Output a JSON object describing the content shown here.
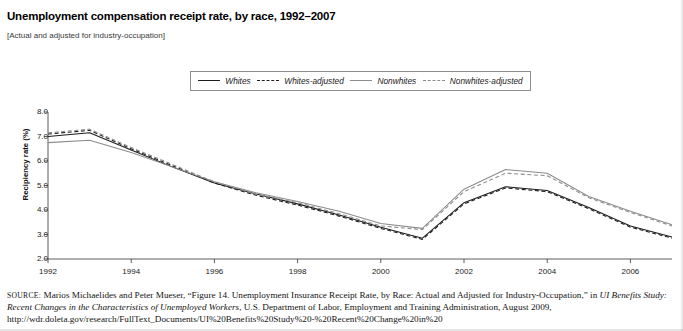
{
  "title": "Unemployment compensation receipt rate, by race, 1992–2007",
  "subtitle": "[Actual and adjusted for industry-occupation]",
  "legend": {
    "entries": [
      {
        "label": "Whites",
        "style": "solid",
        "color": "#1c1c1c"
      },
      {
        "label": "Whites-adjusted",
        "style": "dashed",
        "color": "#1c1c1c"
      },
      {
        "label": "Nonwhites",
        "style": "solid",
        "color": "#8c8c8c"
      },
      {
        "label": "Nonwhites-adjusted",
        "style": "dashed",
        "color": "#8c8c8c"
      }
    ]
  },
  "source": {
    "prefix": "SOURCE:",
    "text_1": " Marios Michaelides and Peter Mueser, “Figure 14. Unemployment Insurance Receipt Rate, by Race: Actual and Adjusted for Industry-Occupation,” in ",
    "italic_1": "UI Benefits Study: Recent Changes in the Characteristics of Unemployed Workers",
    "text_2": ", U.S. Department of Labor, Employment and Training Administration, August 2009, http://wdr.doleta.gov/research/FullText_Documents/UI%20Benefits%20Study%20-%20Recent%20Change%20in%20"
  },
  "chart_data": {
    "type": "line",
    "title": "Unemployment compensation receipt rate, by race, 1992–2007",
    "xlabel": "",
    "ylabel": "Recipiency rate (%)",
    "xlim": [
      1992,
      2007
    ],
    "ylim": [
      2.0,
      8.0
    ],
    "ytick_labels": [
      "8.0",
      "7.0",
      "6.0",
      "5.0",
      "4.0",
      "3.0",
      "2.0"
    ],
    "yticks": [
      8.0,
      7.0,
      6.0,
      5.0,
      4.0,
      3.0,
      2.0
    ],
    "xtick_labels": [
      "1992",
      "1994",
      "1996",
      "1998",
      "2000",
      "2002",
      "2004",
      "2006"
    ],
    "xticks": [
      1992,
      1994,
      1996,
      1998,
      2000,
      2002,
      2004,
      2006
    ],
    "grid": false,
    "legend_position": "top-center",
    "x": [
      1992,
      1993,
      1994,
      1995,
      1996,
      1997,
      1998,
      1999,
      2000,
      2001,
      2002,
      2003,
      2004,
      2005,
      2006,
      2007
    ],
    "series": [
      {
        "name": "Whites",
        "style": "solid",
        "color": "#1c1c1c",
        "values": [
          7.0,
          7.15,
          6.45,
          5.75,
          5.1,
          4.65,
          4.25,
          3.8,
          3.3,
          2.85,
          4.3,
          4.95,
          4.8,
          4.1,
          3.35,
          2.9
        ]
      },
      {
        "name": "Whites-adjusted",
        "style": "dashed",
        "color": "#1c1c1c",
        "values": [
          7.1,
          7.25,
          6.5,
          5.8,
          5.1,
          4.6,
          4.2,
          3.75,
          3.25,
          2.8,
          4.25,
          4.9,
          4.75,
          4.05,
          3.3,
          2.85
        ]
      },
      {
        "name": "Nonwhites",
        "style": "solid",
        "color": "#8c8c8c",
        "values": [
          6.75,
          6.85,
          6.35,
          5.75,
          5.15,
          4.7,
          4.35,
          3.95,
          3.45,
          3.25,
          4.85,
          5.65,
          5.5,
          4.55,
          3.95,
          3.4
        ]
      },
      {
        "name": "Nonwhites-adjusted",
        "style": "dashed",
        "color": "#8c8c8c",
        "values": [
          7.15,
          7.3,
          6.55,
          5.85,
          5.15,
          4.65,
          4.3,
          3.85,
          3.35,
          3.2,
          4.75,
          5.5,
          5.4,
          4.5,
          3.9,
          3.35
        ]
      }
    ]
  }
}
